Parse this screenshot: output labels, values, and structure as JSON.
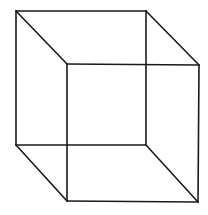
{
  "diagram": {
    "type": "necker-cube",
    "stroke_color": "#1a1a1a",
    "background": "#ffffff",
    "vertices": {
      "back_top_left": [
        16,
        11
      ],
      "back_top_right": [
        146,
        11
      ],
      "back_bottom_left": [
        16,
        145
      ],
      "back_bottom_right": [
        146,
        145
      ],
      "front_top_left": [
        67,
        64
      ],
      "front_top_right": [
        199,
        65
      ],
      "front_bottom_left": [
        67,
        201
      ],
      "front_bottom_right": [
        198,
        202
      ]
    },
    "edges": [
      [
        "back_top_left",
        "back_top_right"
      ],
      [
        "back_top_right",
        "back_bottom_right"
      ],
      [
        "back_bottom_right",
        "back_bottom_left"
      ],
      [
        "back_bottom_left",
        "back_top_left"
      ],
      [
        "front_top_left",
        "front_top_right"
      ],
      [
        "front_top_right",
        "front_bottom_right"
      ],
      [
        "front_bottom_right",
        "front_bottom_left"
      ],
      [
        "front_bottom_left",
        "front_top_left"
      ],
      [
        "back_top_left",
        "front_top_left"
      ],
      [
        "back_top_right",
        "front_top_right"
      ],
      [
        "back_bottom_left",
        "front_bottom_left"
      ],
      [
        "back_bottom_right",
        "front_bottom_right"
      ]
    ]
  }
}
